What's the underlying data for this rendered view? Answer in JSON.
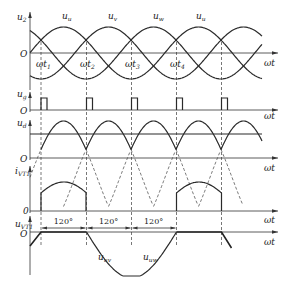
{
  "figure": {
    "panels": [
      {
        "id": "u2",
        "ylabel": "u",
        "ylabel_sub": "2",
        "origin_label": "O",
        "xlabel": "ωt"
      },
      {
        "id": "ug",
        "ylabel": "u",
        "ylabel_sub": "g",
        "origin_label": "O",
        "xlabel": "ωt"
      },
      {
        "id": "ud",
        "ylabel": "u",
        "ylabel_sub": "d",
        "origin_label": "O",
        "xlabel": "ωt"
      },
      {
        "id": "ivt1",
        "ylabel": "i",
        "ylabel_sub": "VT1",
        "origin_label": "0",
        "xlabel": "ωt"
      },
      {
        "id": "uvt1",
        "ylabel": "u",
        "ylabel_sub": "VT1",
        "origin_label": "O",
        "xlabel": "ωt"
      }
    ],
    "phase_labels": [
      {
        "name": "u",
        "sub": "u"
      },
      {
        "name": "u",
        "sub": "v"
      },
      {
        "name": "u",
        "sub": "w"
      },
      {
        "name": "u",
        "sub": "u"
      }
    ],
    "time_markers": [
      {
        "name": "ωt",
        "sub": "1"
      },
      {
        "name": "ωt",
        "sub": "2"
      },
      {
        "name": "ωt",
        "sub": "3"
      },
      {
        "name": "ωt",
        "sub": "4"
      }
    ],
    "interval_labels": [
      "120°",
      "120°",
      "120°"
    ],
    "line_voltage_labels": [
      {
        "name": "u",
        "sub": "uv"
      },
      {
        "name": "u",
        "sub": "uw"
      }
    ]
  },
  "chart_data": {
    "type": "line",
    "x": "ωt",
    "series": [
      {
        "name": "u2 (phases u, v, w)",
        "description": "three sinusoids 120° apart"
      },
      {
        "name": "ug",
        "description": "gate pulses at ωt1, ωt2, ωt3, ωt4 and next"
      },
      {
        "name": "ud",
        "description": "upper envelope of phase voltages"
      },
      {
        "name": "iVT1",
        "description": "conducts 120° from ωt1 to ωt2, repeats"
      },
      {
        "name": "uVT1",
        "description": "0 for 120°, then uuv for 120°, then uuw for 120°"
      }
    ],
    "conduction_angle_deg": 120
  }
}
